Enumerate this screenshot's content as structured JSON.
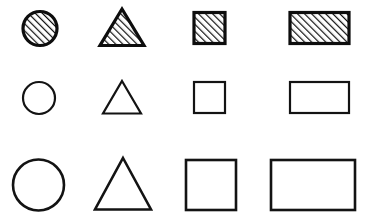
{
  "figure": {
    "width": 369,
    "height": 223,
    "background_color": "#ffffff",
    "stroke_color": "#131313",
    "hatch_color": "#0d0d0d",
    "columns": [
      "circle",
      "triangle",
      "square",
      "rectangle"
    ],
    "rows": [
      {
        "name": "small-hatched-row",
        "label": "small hatched shapes",
        "size": "small",
        "fill": "diagonal-hatch",
        "stroke_width": 3
      },
      {
        "name": "medium-outline-row",
        "label": "medium outline shapes",
        "size": "medium",
        "fill": "none",
        "stroke_width": 2
      },
      {
        "name": "large-outline-row",
        "label": "large outline shapes",
        "size": "large",
        "fill": "none",
        "stroke_width": 2.6
      }
    ]
  },
  "hatch": {
    "angle_degrees": 45,
    "direction": "lower-left to upper-right",
    "spacing": 5,
    "line_width": 2.4,
    "color": "#0d0d0d"
  },
  "shapes": [
    {
      "id": "circle-small-hatched",
      "name": "circle",
      "row": 0,
      "column": 0,
      "fill": "diagonal-hatch",
      "cx": 40,
      "cy": 28.5,
      "r": 17,
      "stroke_width": 3.2
    },
    {
      "id": "triangle-small-hatched",
      "name": "triangle",
      "row": 0,
      "column": 1,
      "fill": "diagonal-hatch",
      "points": "122,9 144,45.5 100,45.5",
      "stroke_width": 3.2
    },
    {
      "id": "square-small-hatched",
      "name": "square",
      "row": 0,
      "column": 2,
      "fill": "diagonal-hatch",
      "x": 194,
      "y": 12.5,
      "width": 31,
      "height": 31,
      "stroke_width": 3.2
    },
    {
      "id": "rectangle-small-hatched",
      "name": "rectangle",
      "row": 0,
      "column": 3,
      "fill": "diagonal-hatch",
      "x": 290,
      "y": 12.5,
      "width": 59,
      "height": 31,
      "stroke_width": 3.2
    },
    {
      "id": "circle-medium-outline",
      "name": "circle",
      "row": 1,
      "column": 0,
      "fill": "none",
      "cx": 39,
      "cy": 98,
      "r": 16,
      "stroke_width": 2.2
    },
    {
      "id": "triangle-medium-outline",
      "name": "triangle",
      "row": 1,
      "column": 1,
      "fill": "none",
      "points": "122,81 141,113.5 103,113.5",
      "stroke_width": 2.2
    },
    {
      "id": "square-medium-outline",
      "name": "square",
      "row": 1,
      "column": 2,
      "fill": "none",
      "x": 194,
      "y": 82,
      "width": 31,
      "height": 31,
      "stroke_width": 2.2
    },
    {
      "id": "rectangle-medium-outline",
      "name": "rectangle",
      "row": 1,
      "column": 3,
      "fill": "none",
      "x": 290,
      "y": 82,
      "width": 59,
      "height": 31,
      "stroke_width": 2.2
    },
    {
      "id": "circle-large-outline",
      "name": "circle",
      "row": 2,
      "column": 0,
      "fill": "none",
      "cx": 38.5,
      "cy": 185,
      "r": 25.5,
      "stroke_width": 2.6
    },
    {
      "id": "triangle-large-outline",
      "name": "triangle",
      "row": 2,
      "column": 1,
      "fill": "none",
      "points": "123,158 151,209.5 95,209.5",
      "stroke_width": 2.6
    },
    {
      "id": "square-large-outline",
      "name": "square",
      "row": 2,
      "column": 2,
      "fill": "none",
      "x": 186,
      "y": 160,
      "width": 50,
      "height": 50,
      "stroke_width": 2.6
    },
    {
      "id": "rectangle-large-outline",
      "name": "rectangle",
      "row": 2,
      "column": 3,
      "fill": "none",
      "x": 271,
      "y": 160,
      "width": 84,
      "height": 50,
      "stroke_width": 2.6
    }
  ]
}
